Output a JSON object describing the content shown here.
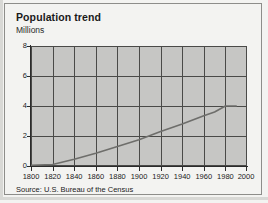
{
  "figure": {
    "title": "Population trend",
    "subtitle": "Millions",
    "source": "Source: U.S. Bureau of the Census"
  },
  "colors": {
    "plot_background": "#c6c6c4",
    "figure_background": "#f3f3f1",
    "gridline": "#4a4a48",
    "axis": "#2b2b2b",
    "data_line": "#6e6e6b",
    "text": "#1a1a1a",
    "frame_border": "#8d8d8a"
  },
  "chart_data": {
    "type": "line",
    "title": "Population trend",
    "subtitle": "Millions",
    "xlabel": "",
    "ylabel": "Millions",
    "xlim": [
      1800,
      2000
    ],
    "ylim": [
      0,
      8
    ],
    "grid": true,
    "legend": "none",
    "source": "Source: U.S. Bureau of the Census",
    "xticks": [
      1800,
      1820,
      1840,
      1860,
      1880,
      1900,
      1920,
      1940,
      1960,
      1980,
      2000
    ],
    "xticklabels": [
      "1800",
      "1820",
      "1840",
      "1860",
      "1880",
      "1900",
      "1920",
      "1940",
      "1960",
      "1980",
      "2000"
    ],
    "yticks": [
      0,
      2,
      4,
      6,
      8
    ],
    "yticklabels": [
      "0",
      "2",
      "4",
      "6",
      "8"
    ],
    "series": [
      {
        "name": "Population",
        "units": "Millions",
        "x": [
          1800,
          1820,
          1840,
          1860,
          1880,
          1900,
          1920,
          1940,
          1960,
          1970,
          1980,
          1990
        ],
        "values": [
          0.05,
          0.1,
          0.45,
          0.85,
          1.3,
          1.75,
          2.3,
          2.8,
          3.35,
          3.6,
          4.0,
          4.0
        ]
      }
    ]
  }
}
